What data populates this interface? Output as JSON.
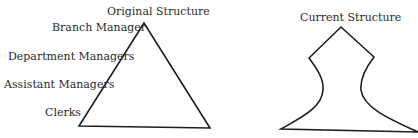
{
  "left_diagram": {
    "title": "Original Structure",
    "levels": [
      "Branch Manager",
      "Department Managers",
      "Assistant Managers",
      "Clerks"
    ]
  },
  "right_diagram": {
    "title": "Current Structure"
  },
  "colors": {
    "stroke": "#1e1e1e",
    "text": "#2a2a2a",
    "background": "#ffffff"
  }
}
